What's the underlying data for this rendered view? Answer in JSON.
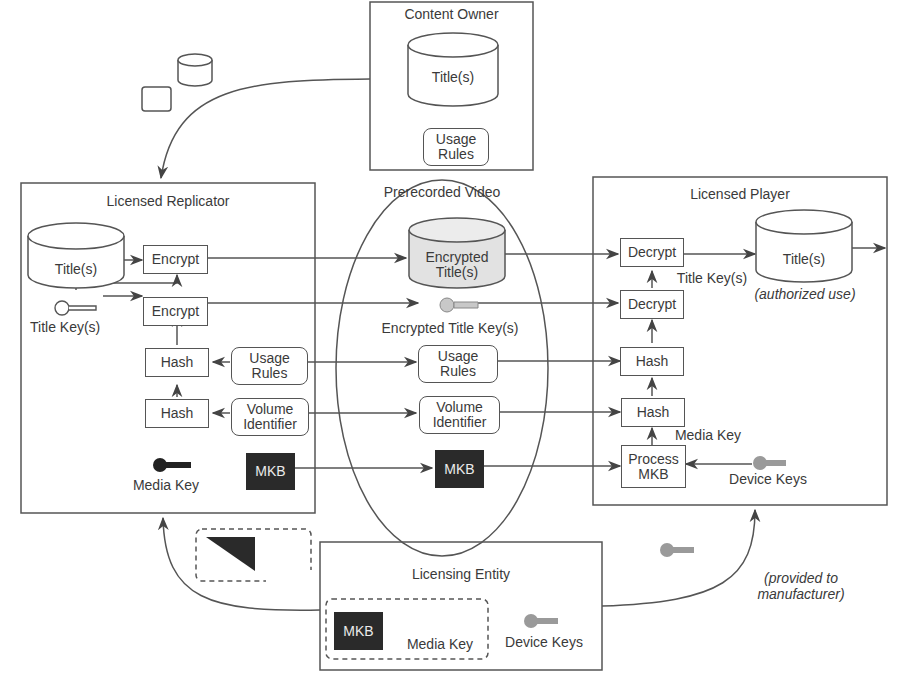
{
  "diagram": {
    "type": "content-protection-flow",
    "colors": {
      "line": "#555555",
      "text": "#3a3a3a",
      "mkb_fill": "#2a2a2a",
      "encrypted_fill": "#e2e2e2",
      "device_key": "#9a9a9a"
    }
  },
  "content_owner": {
    "title": "Content Owner",
    "titles_label": "Title(s)",
    "usage_rules_label": "Usage Rules"
  },
  "licensed_replicator": {
    "title": "Licensed Replicator",
    "titles_label": "Title(s)",
    "encrypt1_label": "Encrypt",
    "encrypt2_label": "Encrypt",
    "title_keys_label": "Title Key(s)",
    "hash1_label": "Hash",
    "hash2_label": "Hash",
    "usage_rules_label": "Usage Rules",
    "volume_identifier_label": "Volume Identifier",
    "media_key_label": "Media Key",
    "mkb_label": "MKB"
  },
  "prerecorded_video": {
    "title": "Prerecorded Video",
    "encrypted_titles_label": "Encrypted Title(s)",
    "encrypted_title_keys_label": "Encrypted Title Key(s)",
    "usage_rules_label": "Usage Rules",
    "volume_identifier_label": "Volume Identifier",
    "mkb_label": "MKB"
  },
  "licensed_player": {
    "title": "Licensed Player",
    "decrypt1_label": "Decrypt",
    "decrypt2_label": "Decrypt",
    "title_keys_label": "Title Key(s)",
    "titles_label": "Title(s)",
    "authorized_use_label": "(authorized use)",
    "hash1_label": "Hash",
    "hash2_label": "Hash",
    "media_key_label": "Media Key",
    "process_mkb_label": "Process MKB",
    "device_keys_label": "Device Keys"
  },
  "licensing_entity": {
    "title": "Licensing Entity",
    "mkb_label": "MKB",
    "media_key_label": "Media Key",
    "device_keys_label": "Device Keys",
    "provided_note": "(provided to manufacturer)"
  }
}
